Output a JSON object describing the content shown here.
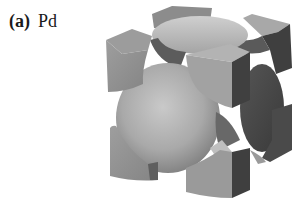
{
  "figure": {
    "panel_label": "(a)",
    "element": "Pd"
  },
  "colors": {
    "background": "#ffffff",
    "light_face": "#b8b8b8",
    "mid_face": "#8f8f8f",
    "dark_face": "#4a4a4a",
    "sphere_highlight": "#c8c8c8"
  }
}
